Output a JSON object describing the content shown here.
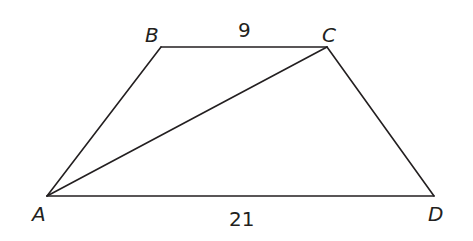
{
  "diagram": {
    "type": "trapezoid",
    "vertices": [
      {
        "id": "A",
        "label": "A",
        "x": 47,
        "y": 196,
        "label_x": 32,
        "label_y": 220
      },
      {
        "id": "B",
        "label": "B",
        "x": 161,
        "y": 47,
        "label_x": 145,
        "label_y": 42
      },
      {
        "id": "C",
        "label": "C",
        "x": 327,
        "y": 47,
        "label_x": 322,
        "label_y": 42
      },
      {
        "id": "D",
        "label": "D",
        "x": 434,
        "y": 196,
        "label_x": 428,
        "label_y": 220
      }
    ],
    "edges": [
      {
        "from": "A",
        "to": "B"
      },
      {
        "from": "B",
        "to": "C"
      },
      {
        "from": "C",
        "to": "D"
      },
      {
        "from": "D",
        "to": "A"
      },
      {
        "from": "A",
        "to": "C"
      }
    ],
    "measurements": {
      "BC": "9",
      "AD": "21"
    },
    "line_color": "#231f20"
  }
}
